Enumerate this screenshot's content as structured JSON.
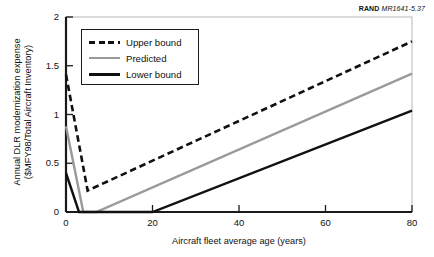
{
  "credit": {
    "brand": "RAND",
    "code": "MR1641-5.37"
  },
  "chart_data": {
    "type": "line",
    "title": "",
    "xlabel": "Aircraft fleet average age (years)",
    "ylabel": "Annual DLR modernization expense ($MFY98/Total Aircraft Inventory)",
    "ylabel_line1": "Annual DLR modernization expense",
    "ylabel_line2": "($MFY98/Total Aircraft Inventory)",
    "xlim": [
      0,
      80
    ],
    "ylim": [
      0,
      2
    ],
    "xticks": [
      0,
      20,
      40,
      60,
      80
    ],
    "xtick_labels": [
      "0",
      "20",
      "40",
      "60",
      "80"
    ],
    "yticks": [
      0,
      0.5,
      1,
      1.5,
      2
    ],
    "ytick_labels": [
      "0",
      "0.5",
      "1",
      "1.5",
      "2"
    ],
    "grid": false,
    "legend_position": "upper left",
    "series": [
      {
        "name": "Upper bound",
        "style": "dashed",
        "color": "#111111",
        "x": [
          0,
          5,
          80
        ],
        "y": [
          1.41,
          0.22,
          1.75
        ]
      },
      {
        "name": "Predicted",
        "style": "solid",
        "color": "#9a9a9a",
        "x": [
          0,
          4,
          7,
          80
        ],
        "y": [
          0.88,
          0,
          0,
          1.42
        ]
      },
      {
        "name": "Lower bound",
        "style": "solid",
        "color": "#111111",
        "x": [
          0,
          3,
          20,
          80
        ],
        "y": [
          0.4,
          0,
          0,
          1.04
        ]
      }
    ]
  }
}
